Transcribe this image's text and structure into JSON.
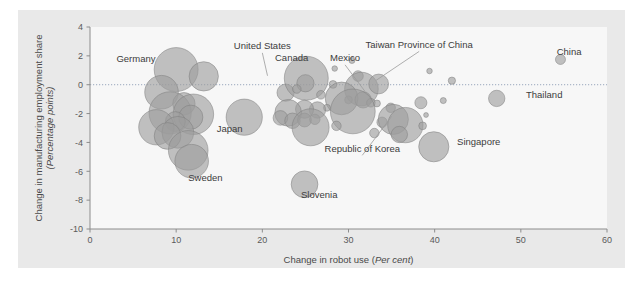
{
  "chart_data": {
    "type": "scatter",
    "title": "",
    "xlabel_main": "Change in robot use (",
    "xlabel_italic": "Per cent",
    "xlabel_tail": ")",
    "ylabel_main": "Change in manufacturing employment share",
    "ylabel_italic": "(Percentage points)",
    "xlim": [
      0,
      60
    ],
    "ylim": [
      -10,
      4
    ],
    "xticks": [
      0,
      10,
      20,
      30,
      40,
      50,
      60
    ],
    "yticks": [
      4,
      2,
      0,
      -2,
      -4,
      -6,
      -8,
      -10
    ],
    "xtick_labels": [
      "0",
      "10",
      "20",
      "30",
      "40",
      "50",
      "60"
    ],
    "ytick_labels": [
      "4",
      "2",
      "0",
      "-2",
      "-4",
      "-6",
      "-8",
      "-10"
    ],
    "grid": false,
    "zero_reference_line": 0,
    "legend": "none",
    "bubble_fill": "#9c9c9c",
    "bubble_stroke": "#7e7e7e",
    "bubble_opacity": 0.62,
    "plot_bg": "#f7f7f7",
    "figure_bg": "#e9e9e9",
    "annotations": [
      {
        "label": "Germany",
        "x": 7.6,
        "y": 1.55,
        "anchor": "end",
        "leader": null
      },
      {
        "label": "United States",
        "x": 20.0,
        "y": 2.45,
        "anchor": "middle",
        "leader": {
          "x2": 20.6,
          "y2": 0.62
        }
      },
      {
        "label": "Canada",
        "x": 23.4,
        "y": 1.62,
        "anchor": "middle",
        "leader": null
      },
      {
        "label": "Mexico",
        "x": 29.6,
        "y": 1.62,
        "anchor": "middle",
        "leader": {
          "x2": 31.9,
          "y2": -0.45
        }
      },
      {
        "label": "Taiwan Province of China",
        "x": 38.2,
        "y": 2.55,
        "anchor": "middle",
        "leader": {
          "x2": 33.2,
          "y2": 0.3
        }
      },
      {
        "label": "China",
        "x": 55.6,
        "y": 2.08,
        "anchor": "middle",
        "leader": null
      },
      {
        "label": "Thailand",
        "x": 50.6,
        "y": -0.95,
        "anchor": "start",
        "leader": null
      },
      {
        "label": "Japan",
        "x": 16.2,
        "y": -3.25,
        "anchor": "middle",
        "leader": null
      },
      {
        "label": "Republic of Korea",
        "x": 31.6,
        "y": -4.65,
        "anchor": "middle",
        "leader": {
          "x2": 35.0,
          "y2": -2.2
        }
      },
      {
        "label": "Singapore",
        "x": 42.6,
        "y": -4.2,
        "anchor": "start",
        "leader": null
      },
      {
        "label": "Sweden",
        "x": 13.4,
        "y": -6.7,
        "anchor": "middle",
        "leader": null
      },
      {
        "label": "Slovenia",
        "x": 26.6,
        "y": -7.85,
        "anchor": "middle",
        "leader": null
      }
    ],
    "points": [
      {
        "x": 10.0,
        "y": 1.05,
        "r": 2.55
      },
      {
        "x": 13.2,
        "y": 0.58,
        "r": 1.7
      },
      {
        "x": 8.3,
        "y": -0.52,
        "r": 1.95
      },
      {
        "x": 10.9,
        "y": -1.32,
        "r": 1.3
      },
      {
        "x": 9.3,
        "y": -1.95,
        "r": 2.45
      },
      {
        "x": 12.0,
        "y": -2.05,
        "r": 2.35
      },
      {
        "x": 11.7,
        "y": -2.25,
        "r": 1.4
      },
      {
        "x": 9.9,
        "y": -2.55,
        "r": 1.15
      },
      {
        "x": 7.7,
        "y": -2.95,
        "r": 2.05
      },
      {
        "x": 10.2,
        "y": -3.3,
        "r": 1.85
      },
      {
        "x": 9.0,
        "y": -3.55,
        "r": 1.55
      },
      {
        "x": 11.4,
        "y": -4.55,
        "r": 2.3
      },
      {
        "x": 17.9,
        "y": -2.25,
        "r": 2.1
      },
      {
        "x": 22.7,
        "y": -0.55,
        "r": 1.0
      },
      {
        "x": 25.1,
        "y": 0.45,
        "r": 2.55
      },
      {
        "x": 25.0,
        "y": 0.1,
        "r": 1.0
      },
      {
        "x": 24.0,
        "y": -0.3,
        "r": 0.5
      },
      {
        "x": 26.8,
        "y": -0.7,
        "r": 0.5
      },
      {
        "x": 28.2,
        "y": 0.02,
        "r": 0.45
      },
      {
        "x": 28.4,
        "y": 1.12,
        "r": 0.32
      },
      {
        "x": 30.4,
        "y": 1.68,
        "r": 0.35
      },
      {
        "x": 31.1,
        "y": 0.6,
        "r": 0.62
      },
      {
        "x": 31.5,
        "y": -0.3,
        "r": 1.95
      },
      {
        "x": 33.5,
        "y": 0.05,
        "r": 1.15
      },
      {
        "x": 30.0,
        "y": -1.05,
        "r": 0.45
      },
      {
        "x": 29.2,
        "y": -0.95,
        "r": 1.9
      },
      {
        "x": 31.7,
        "y": -1.05,
        "r": 0.95
      },
      {
        "x": 32.6,
        "y": -1.25,
        "r": 0.5
      },
      {
        "x": 33.3,
        "y": -1.3,
        "r": 0.4
      },
      {
        "x": 30.5,
        "y": -1.85,
        "r": 2.6
      },
      {
        "x": 27.5,
        "y": -1.6,
        "r": 0.4
      },
      {
        "x": 26.4,
        "y": -1.75,
        "r": 0.95
      },
      {
        "x": 24.9,
        "y": -1.7,
        "r": 1.05
      },
      {
        "x": 23.0,
        "y": -1.95,
        "r": 1.55
      },
      {
        "x": 22.1,
        "y": -2.3,
        "r": 0.85
      },
      {
        "x": 23.5,
        "y": -2.5,
        "r": 0.9
      },
      {
        "x": 24.9,
        "y": -2.45,
        "r": 0.8
      },
      {
        "x": 26.1,
        "y": -2.4,
        "r": 0.6
      },
      {
        "x": 25.6,
        "y": -2.95,
        "r": 2.15
      },
      {
        "x": 28.6,
        "y": -2.85,
        "r": 0.55
      },
      {
        "x": 33.9,
        "y": -2.6,
        "r": 0.6
      },
      {
        "x": 34.9,
        "y": -1.6,
        "r": 0.55
      },
      {
        "x": 35.2,
        "y": -2.4,
        "r": 1.75
      },
      {
        "x": 36.6,
        "y": -2.8,
        "r": 2.05
      },
      {
        "x": 35.9,
        "y": -3.45,
        "r": 0.95
      },
      {
        "x": 33.0,
        "y": -3.35,
        "r": 0.55
      },
      {
        "x": 38.4,
        "y": -1.25,
        "r": 0.7
      },
      {
        "x": 38.6,
        "y": -2.85,
        "r": 0.45
      },
      {
        "x": 39.4,
        "y": 0.95,
        "r": 0.32
      },
      {
        "x": 42.0,
        "y": 0.28,
        "r": 0.42
      },
      {
        "x": 41.0,
        "y": -1.1,
        "r": 0.35
      },
      {
        "x": 39.0,
        "y": -2.1,
        "r": 0.28
      },
      {
        "x": 39.9,
        "y": -4.3,
        "r": 1.75
      },
      {
        "x": 47.2,
        "y": -0.95,
        "r": 0.95
      },
      {
        "x": 54.6,
        "y": 1.75,
        "r": 0.58
      },
      {
        "x": 24.9,
        "y": -6.9,
        "r": 1.55
      },
      {
        "x": 11.8,
        "y": -5.3,
        "r": 1.95
      }
    ]
  }
}
